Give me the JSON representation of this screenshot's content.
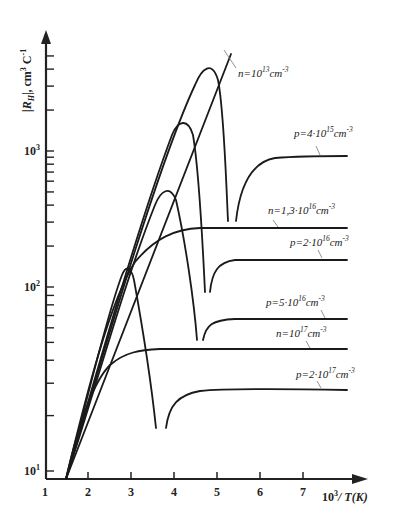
{
  "chart_data": {
    "type": "line",
    "title": "",
    "xlabel": "10³/T(K)",
    "ylabel": "|R_H|, cm³C⁻¹",
    "xscale": "linear",
    "yscale": "log",
    "xlim": [
      1,
      8
    ],
    "ylim": [
      8,
      10000
    ],
    "grid": false,
    "legend_position": "inline labels",
    "x_ticks": [
      "1",
      "2",
      "3",
      "4",
      "5",
      "6",
      "7"
    ],
    "y_ticks": [
      {
        "label": "10",
        "sup": "1",
        "value": 10
      },
      {
        "label": "10",
        "sup": "2",
        "value": 100
      },
      {
        "label": "10",
        "sup": "3",
        "value": 1000
      }
    ],
    "series": [
      {
        "name": "n=10^13 cm^-3",
        "label_base": "n=10",
        "label_sup": "13",
        "label_unit": "cm",
        "label_unit_sup": "-3",
        "x": [
          1.5,
          3.0,
          4.0,
          5.0,
          5.3
        ],
        "y": [
          8,
          120,
          700,
          4000,
          6500
        ]
      },
      {
        "name": "p=4·10^15 cm^-3",
        "label_base": "p=4·10",
        "label_sup": "15",
        "label_unit": "cm",
        "label_unit_sup": "-3",
        "x": [
          1.5,
          3.0,
          4.0,
          4.75,
          5.0,
          5.2,
          5.25,
          5.4,
          5.6,
          6.0,
          7.0,
          7.4
        ],
        "y": [
          8,
          130,
          900,
          4100,
          2500,
          700,
          300,
          300,
          700,
          880,
          910,
          910
        ]
      },
      {
        "name": "n=1,3·10^16 cm^-3",
        "label_base": "n=1,3·10",
        "label_sup": "16",
        "label_unit": "cm",
        "label_unit_sup": "-3",
        "x": [
          1.5,
          2.5,
          3.0,
          3.5,
          4.0,
          4.5,
          5.0,
          6.0,
          7.4
        ],
        "y": [
          8,
          60,
          140,
          220,
          260,
          270,
          270,
          270,
          270
        ]
      },
      {
        "name": "p=2·10^16 cm^-3",
        "label_base": "p=2·10",
        "label_sup": "16",
        "label_unit": "cm",
        "label_unit_sup": "-3",
        "x": [
          1.5,
          3.0,
          3.8,
          4.15,
          4.5,
          4.75,
          4.85,
          5.0,
          5.5,
          6.0,
          7.4
        ],
        "y": [
          8,
          140,
          800,
          1550,
          900,
          94,
          94,
          140,
          157,
          158,
          158
        ]
      },
      {
        "name": "p=5·10^16 cm^-3",
        "label_base": "p=5·10",
        "label_sup": "16",
        "label_unit": "cm",
        "label_unit_sup": "-3",
        "x": [
          1.5,
          2.5,
          3.4,
          3.8,
          4.2,
          4.45,
          4.6,
          4.8,
          5.2,
          6.0,
          7.4
        ],
        "y": [
          8,
          60,
          300,
          520,
          300,
          52,
          52,
          60,
          65,
          66,
          66
        ]
      },
      {
        "name": "n=10^17 cm^-3",
        "label_base": "n=10",
        "label_sup": "17",
        "label_unit": "cm",
        "label_unit_sup": "-3",
        "x": [
          1.5,
          2.0,
          2.5,
          3.0,
          3.5,
          4.0,
          5.0,
          6.0,
          7.4
        ],
        "y": [
          8,
          20,
          35,
          42,
          45,
          45,
          45,
          45,
          45
        ]
      },
      {
        "name": "p=2·10^17 cm^-3",
        "label_base": "p=2·10",
        "label_sup": "17",
        "label_unit": "cm",
        "label_unit_sup": "-3",
        "x": [
          1.5,
          2.5,
          2.9,
          3.2,
          3.55,
          3.8,
          4.0,
          4.5,
          5.0,
          6.0,
          7.4
        ],
        "y": [
          8,
          80,
          138,
          70,
          17,
          17,
          24,
          27,
          28,
          28,
          27
        ]
      }
    ]
  },
  "axes": {
    "x_title_base": "10",
    "x_title_sup": "3",
    "x_title_rest": "/ T(K)",
    "y_title_main": "|R",
    "y_title_sub": "H",
    "y_title_rest": "|, cm",
    "y_title_sup1": "3",
    "y_title_c": " C",
    "y_title_sup2": "-1"
  }
}
